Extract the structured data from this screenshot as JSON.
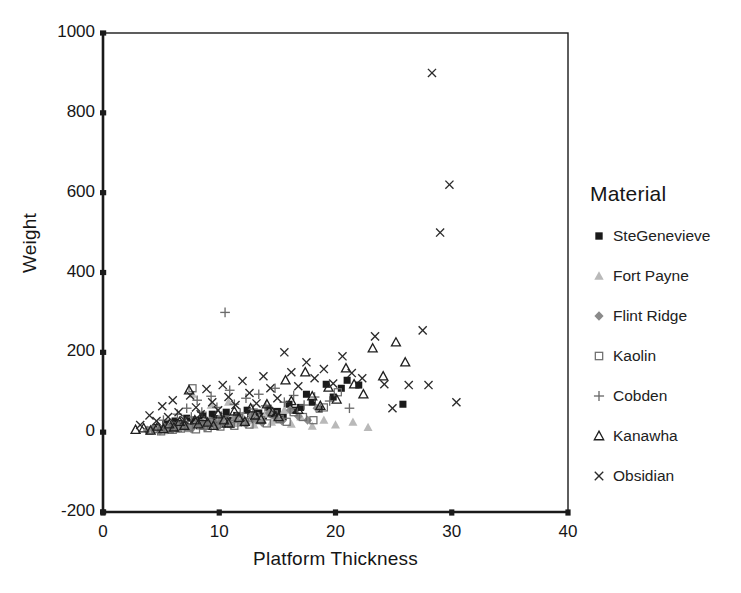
{
  "chart_data": {
    "type": "scatter",
    "title": "",
    "xlabel": "Platform Thickness",
    "ylabel": "Weight",
    "xlim": [
      0,
      40
    ],
    "ylim": [
      -200,
      1000
    ],
    "xticks": [
      0,
      10,
      20,
      30,
      40
    ],
    "yticks": [
      -200,
      0,
      200,
      400,
      600,
      800,
      1000
    ],
    "grid": false,
    "legend_title": "Material",
    "legend_position": "right",
    "series": [
      {
        "name": "SteGenevieve",
        "marker": "filled-square",
        "color": "#1a1a1a",
        "points": [
          [
            4.6,
            12
          ],
          [
            5.1,
            8
          ],
          [
            5.4,
            20
          ],
          [
            5.8,
            5
          ],
          [
            6.0,
            15
          ],
          [
            6.2,
            28
          ],
          [
            6.5,
            10
          ],
          [
            6.8,
            22
          ],
          [
            7.0,
            18
          ],
          [
            7.2,
            35
          ],
          [
            7.5,
            12
          ],
          [
            7.8,
            25
          ],
          [
            8.0,
            30
          ],
          [
            8.3,
            16
          ],
          [
            8.6,
            40
          ],
          [
            8.9,
            22
          ],
          [
            9.1,
            18
          ],
          [
            9.4,
            45
          ],
          [
            9.7,
            28
          ],
          [
            10.0,
            34
          ],
          [
            10.3,
            20
          ],
          [
            10.6,
            50
          ],
          [
            10.9,
            30
          ],
          [
            11.2,
            25
          ],
          [
            11.5,
            42
          ],
          [
            11.8,
            36
          ],
          [
            12.1,
            28
          ],
          [
            12.4,
            55
          ],
          [
            12.7,
            38
          ],
          [
            13.0,
            30
          ],
          [
            13.4,
            48
          ],
          [
            13.8,
            40
          ],
          [
            14.2,
            60
          ],
          [
            14.6,
            45
          ],
          [
            15.0,
            52
          ],
          [
            15.5,
            38
          ],
          [
            16.0,
            70
          ],
          [
            16.5,
            55
          ],
          [
            17.0,
            62
          ],
          [
            17.5,
            95
          ],
          [
            18.0,
            75
          ],
          [
            18.6,
            58
          ],
          [
            19.2,
            120
          ],
          [
            19.8,
            88
          ],
          [
            20.5,
            110
          ],
          [
            21.0,
            130
          ],
          [
            22.0,
            118
          ],
          [
            25.8,
            70
          ]
        ]
      },
      {
        "name": "Fort Payne",
        "marker": "filled-triangle",
        "color": "#b9b9b9",
        "points": [
          [
            4.2,
            6
          ],
          [
            4.8,
            10
          ],
          [
            5.2,
            4
          ],
          [
            5.6,
            14
          ],
          [
            6.0,
            8
          ],
          [
            6.4,
            18
          ],
          [
            6.8,
            12
          ],
          [
            7.1,
            25
          ],
          [
            7.4,
            9
          ],
          [
            7.7,
            95
          ],
          [
            8.0,
            20
          ],
          [
            8.4,
            15
          ],
          [
            8.7,
            30
          ],
          [
            9.0,
            22
          ],
          [
            9.3,
            68
          ],
          [
            9.6,
            18
          ],
          [
            10.0,
            35
          ],
          [
            10.4,
            26
          ],
          [
            10.8,
            75
          ],
          [
            11.2,
            30
          ],
          [
            11.6,
            22
          ],
          [
            12.0,
            40
          ],
          [
            12.5,
            28
          ],
          [
            13.0,
            18
          ],
          [
            13.5,
            35
          ],
          [
            14.0,
            45
          ],
          [
            14.5,
            25
          ],
          [
            15.0,
            30
          ],
          [
            15.6,
            55
          ],
          [
            16.2,
            20
          ],
          [
            17.0,
            38
          ],
          [
            18.0,
            15
          ],
          [
            19.0,
            30
          ],
          [
            20.0,
            18
          ],
          [
            21.5,
            25
          ],
          [
            22.8,
            12
          ]
        ]
      },
      {
        "name": "Flint Ridge",
        "marker": "filled-diamond",
        "color": "#8a8a8a",
        "points": [
          [
            3.8,
            5
          ],
          [
            4.3,
            9
          ],
          [
            4.9,
            3
          ],
          [
            5.3,
            12
          ],
          [
            5.7,
            7
          ],
          [
            6.1,
            16
          ],
          [
            6.6,
            10
          ],
          [
            7.0,
            20
          ],
          [
            7.3,
            14
          ],
          [
            7.6,
            8
          ],
          [
            8.1,
            24
          ],
          [
            8.5,
            18
          ],
          [
            8.8,
            12
          ],
          [
            9.2,
            28
          ],
          [
            9.5,
            20
          ],
          [
            9.9,
            15
          ],
          [
            10.2,
            32
          ],
          [
            10.7,
            22
          ],
          [
            11.0,
            18
          ],
          [
            11.4,
            36
          ],
          [
            11.9,
            25
          ],
          [
            12.3,
            20
          ],
          [
            12.8,
            42
          ],
          [
            13.2,
            30
          ],
          [
            13.7,
            24
          ],
          [
            14.3,
            48
          ],
          [
            14.9,
            35
          ],
          [
            15.4,
            28
          ],
          [
            16.1,
            55
          ],
          [
            16.8,
            40
          ],
          [
            17.6,
            30
          ],
          [
            18.4,
            60
          ]
        ]
      },
      {
        "name": "Kaolin",
        "marker": "open-square",
        "color": "#6e6e6e",
        "points": [
          [
            4.0,
            4
          ],
          [
            4.5,
            8
          ],
          [
            5.0,
            2
          ],
          [
            5.5,
            11
          ],
          [
            6.0,
            6
          ],
          [
            6.3,
            14
          ],
          [
            6.7,
            9
          ],
          [
            7.0,
            18
          ],
          [
            7.4,
            12
          ],
          [
            7.7,
            110
          ],
          [
            8.0,
            7
          ],
          [
            8.3,
            22
          ],
          [
            8.7,
            16
          ],
          [
            9.0,
            10
          ],
          [
            9.4,
            26
          ],
          [
            9.8,
            19
          ],
          [
            10.1,
            14
          ],
          [
            10.5,
            30
          ],
          [
            11.0,
            21
          ],
          [
            11.3,
            16
          ],
          [
            11.7,
            35
          ],
          [
            12.2,
            25
          ],
          [
            12.6,
            19
          ],
          [
            13.1,
            40
          ],
          [
            13.6,
            30
          ],
          [
            14.1,
            22
          ],
          [
            14.7,
            45
          ],
          [
            15.2,
            33
          ],
          [
            15.8,
            26
          ],
          [
            16.4,
            50
          ],
          [
            17.2,
            38
          ],
          [
            18.1,
            30
          ],
          [
            19.0,
            62
          ],
          [
            20.2,
            100
          ]
        ]
      },
      {
        "name": "Cobden",
        "marker": "plus",
        "color": "#6b6b6b",
        "points": [
          [
            5.2,
            30
          ],
          [
            5.9,
            18
          ],
          [
            6.4,
            45
          ],
          [
            6.9,
            25
          ],
          [
            7.2,
            60
          ],
          [
            7.6,
            38
          ],
          [
            8.1,
            80
          ],
          [
            8.5,
            50
          ],
          [
            8.9,
            28
          ],
          [
            9.3,
            90
          ],
          [
            9.8,
            62
          ],
          [
            10.2,
            40
          ],
          [
            10.5,
            300
          ],
          [
            10.9,
            105
          ],
          [
            11.3,
            70
          ],
          [
            11.8,
            48
          ],
          [
            12.3,
            85
          ],
          [
            12.9,
            58
          ],
          [
            13.4,
            95
          ],
          [
            14.0,
            66
          ],
          [
            14.8,
            110
          ],
          [
            15.6,
            75
          ],
          [
            16.4,
            92
          ],
          [
            17.3,
            68
          ],
          [
            18.2,
            88
          ],
          [
            19.5,
            78
          ],
          [
            21.2,
            60
          ]
        ]
      },
      {
        "name": "Kanawha",
        "marker": "open-triangle",
        "color": "#1f1f1f",
        "points": [
          [
            2.8,
            6
          ],
          [
            3.5,
            10
          ],
          [
            4.1,
            4
          ],
          [
            4.7,
            14
          ],
          [
            5.2,
            8
          ],
          [
            5.7,
            20
          ],
          [
            6.1,
            12
          ],
          [
            6.6,
            26
          ],
          [
            7.0,
            16
          ],
          [
            7.4,
            105
          ],
          [
            7.9,
            30
          ],
          [
            8.2,
            20
          ],
          [
            8.6,
            38
          ],
          [
            9.0,
            24
          ],
          [
            9.5,
            16
          ],
          [
            9.9,
            45
          ],
          [
            10.4,
            30
          ],
          [
            10.8,
            22
          ],
          [
            11.3,
            52
          ],
          [
            11.7,
            36
          ],
          [
            12.2,
            26
          ],
          [
            12.7,
            60
          ],
          [
            13.1,
            42
          ],
          [
            13.6,
            32
          ],
          [
            14.1,
            70
          ],
          [
            14.6,
            50
          ],
          [
            15.1,
            38
          ],
          [
            15.7,
            130
          ],
          [
            16.2,
            78
          ],
          [
            16.8,
            56
          ],
          [
            17.4,
            150
          ],
          [
            18.0,
            90
          ],
          [
            18.7,
            66
          ],
          [
            19.4,
            112
          ],
          [
            20.1,
            82
          ],
          [
            20.9,
            160
          ],
          [
            21.6,
            120
          ],
          [
            22.4,
            95
          ],
          [
            23.2,
            210
          ],
          [
            24.1,
            140
          ],
          [
            25.2,
            225
          ],
          [
            26.0,
            175
          ]
        ]
      },
      {
        "name": "Obsidian",
        "marker": "x",
        "color": "#2b2b2b",
        "points": [
          [
            3.2,
            18
          ],
          [
            4.0,
            42
          ],
          [
            4.6,
            28
          ],
          [
            5.1,
            65
          ],
          [
            5.6,
            38
          ],
          [
            6.0,
            80
          ],
          [
            6.5,
            50
          ],
          [
            7.0,
            30
          ],
          [
            7.5,
            92
          ],
          [
            8.0,
            62
          ],
          [
            8.4,
            45
          ],
          [
            8.9,
            108
          ],
          [
            9.4,
            75
          ],
          [
            9.9,
            55
          ],
          [
            10.3,
            118
          ],
          [
            10.8,
            88
          ],
          [
            11.4,
            68
          ],
          [
            12.0,
            128
          ],
          [
            12.6,
            98
          ],
          [
            13.2,
            72
          ],
          [
            13.8,
            140
          ],
          [
            14.4,
            110
          ],
          [
            15.0,
            85
          ],
          [
            15.6,
            200
          ],
          [
            16.2,
            150
          ],
          [
            16.8,
            115
          ],
          [
            17.5,
            175
          ],
          [
            18.2,
            135
          ],
          [
            19.0,
            158
          ],
          [
            19.8,
            122
          ],
          [
            20.6,
            190
          ],
          [
            21.4,
            148
          ],
          [
            22.3,
            135
          ],
          [
            23.4,
            240
          ],
          [
            24.2,
            120
          ],
          [
            24.9,
            60
          ],
          [
            26.3,
            118
          ],
          [
            27.5,
            255
          ],
          [
            28.3,
            900
          ],
          [
            29.0,
            500
          ],
          [
            29.8,
            620
          ],
          [
            30.4,
            75
          ],
          [
            28.0,
            118
          ]
        ]
      }
    ]
  },
  "axes": {
    "x_title": "Platform Thickness",
    "y_title": "Weight",
    "x_tick_labels": [
      "0",
      "10",
      "20",
      "30",
      "40"
    ],
    "y_tick_labels": [
      "1000",
      "800",
      "600",
      "400",
      "200",
      "0",
      "-200"
    ]
  },
  "legend": {
    "title": "Material",
    "items": [
      {
        "label": "SteGenevieve",
        "marker": "filled-square",
        "color": "#1a1a1a"
      },
      {
        "label": "Fort Payne",
        "marker": "filled-triangle",
        "color": "#b9b9b9"
      },
      {
        "label": "Flint Ridge",
        "marker": "filled-diamond",
        "color": "#8a8a8a"
      },
      {
        "label": "Kaolin",
        "marker": "open-square",
        "color": "#6e6e6e"
      },
      {
        "label": "Cobden",
        "marker": "plus",
        "color": "#6b6b6b"
      },
      {
        "label": "Kanawha",
        "marker": "open-triangle",
        "color": "#1f1f1f"
      },
      {
        "label": "Obsidian",
        "marker": "x",
        "color": "#2b2b2b"
      }
    ]
  },
  "style": {
    "axis_color": "#1a1a1a",
    "background": "#ffffff"
  }
}
